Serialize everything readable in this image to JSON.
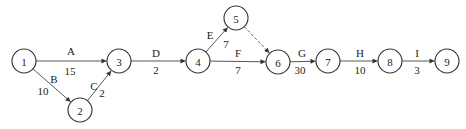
{
  "diagram": {
    "type": "activity-on-arrow network",
    "colors": {
      "stroke": "#333333",
      "text": "#222222",
      "background": "#ffffff"
    },
    "nodes": [
      {
        "id": "1",
        "label": "1",
        "x": 24,
        "y": 61
      },
      {
        "id": "2",
        "label": "2",
        "x": 80,
        "y": 110
      },
      {
        "id": "3",
        "label": "3",
        "x": 119,
        "y": 61
      },
      {
        "id": "4",
        "label": "4",
        "x": 198,
        "y": 61
      },
      {
        "id": "5",
        "label": "5",
        "x": 236,
        "y": 18
      },
      {
        "id": "6",
        "label": "6",
        "x": 278,
        "y": 62
      },
      {
        "id": "7",
        "label": "7",
        "x": 328,
        "y": 61
      },
      {
        "id": "8",
        "label": "8",
        "x": 390,
        "y": 61
      },
      {
        "id": "9",
        "label": "9",
        "x": 447,
        "y": 61
      }
    ],
    "edges": [
      {
        "from": "1",
        "to": "3",
        "activity": "A",
        "duration": "15",
        "dashed": false,
        "activity_pos": [
          71,
          51
        ],
        "duration_pos": [
          70,
          71
        ]
      },
      {
        "from": "1",
        "to": "2",
        "activity": "B",
        "duration": "10",
        "dashed": false,
        "activity_pos": [
          54,
          79
        ],
        "duration_pos": [
          43,
          91
        ]
      },
      {
        "from": "2",
        "to": "3",
        "activity": "C",
        "duration": "2",
        "dashed": false,
        "activity_pos": [
          94,
          86
        ],
        "duration_pos": [
          102,
          93
        ]
      },
      {
        "from": "3",
        "to": "4",
        "activity": "D",
        "duration": "2",
        "dashed": false,
        "activity_pos": [
          156,
          53
        ],
        "duration_pos": [
          156,
          70
        ]
      },
      {
        "from": "4",
        "to": "5",
        "activity": "E",
        "duration": "7",
        "dashed": false,
        "activity_pos": [
          210,
          35
        ],
        "duration_pos": [
          226,
          44
        ]
      },
      {
        "from": "4",
        "to": "6",
        "activity": "F",
        "duration": "7",
        "dashed": false,
        "activity_pos": [
          238,
          53
        ],
        "duration_pos": [
          238,
          70
        ]
      },
      {
        "from": "5",
        "to": "6",
        "activity": "",
        "duration": "",
        "dashed": true,
        "activity_pos": null,
        "duration_pos": null
      },
      {
        "from": "6",
        "to": "7",
        "activity": "G",
        "duration": "30",
        "dashed": false,
        "activity_pos": [
          302,
          53
        ],
        "duration_pos": [
          300,
          70
        ]
      },
      {
        "from": "7",
        "to": "8",
        "activity": "H",
        "duration": "10",
        "dashed": false,
        "activity_pos": [
          360,
          53
        ],
        "duration_pos": [
          360,
          70
        ]
      },
      {
        "from": "8",
        "to": "9",
        "activity": "I",
        "duration": "3",
        "dashed": false,
        "activity_pos": [
          417,
          53
        ],
        "duration_pos": [
          417,
          70
        ]
      }
    ]
  }
}
